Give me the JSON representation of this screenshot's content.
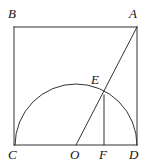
{
  "figure": {
    "kind": "plane-geometry-diagram",
    "stroke_color": "#333333",
    "background_color": "#ffffff",
    "stroke_width": 1,
    "canvas": {
      "width": 150,
      "height": 166
    }
  },
  "points": {
    "B": {
      "label": "B",
      "x": 14,
      "y": 27,
      "label_x": 8,
      "label_y": 7
    },
    "A": {
      "label": "A",
      "x": 137,
      "y": 27,
      "label_x": 129,
      "label_y": 7
    },
    "C": {
      "label": "C",
      "x": 14,
      "y": 145,
      "label_x": 8,
      "label_y": 148
    },
    "D": {
      "label": "D",
      "x": 137,
      "y": 145,
      "label_x": 129,
      "label_y": 148
    },
    "O": {
      "label": "O",
      "x": 76,
      "y": 145,
      "label_x": 70,
      "label_y": 148
    },
    "F": {
      "label": "F",
      "x": 104,
      "y": 145,
      "label_x": 99,
      "label_y": 148
    },
    "E": {
      "label": "E",
      "x": 104,
      "y": 95,
      "label_x": 91,
      "label_y": 73
    }
  },
  "segments": [
    {
      "name": "side-BC",
      "from": "B",
      "to": "C"
    },
    {
      "name": "side-BA",
      "from": "B",
      "to": "A"
    },
    {
      "name": "side-AD",
      "from": "A",
      "to": "D"
    },
    {
      "name": "side-CD",
      "from": "C",
      "to": "D"
    },
    {
      "name": "diagonal-OA",
      "from": "O",
      "to": "A"
    },
    {
      "name": "perpendicular-EF",
      "from": "E",
      "to": "F"
    }
  ],
  "arc": {
    "name": "semicircle-CD",
    "center": "O",
    "center_x": 76,
    "center_y": 145,
    "radius": 61,
    "start_x": 15,
    "start_y": 145,
    "end_x": 137,
    "end_y": 145,
    "path": "M 15 145 A 61 61 0 0 1 137 145"
  },
  "labels": {
    "B": "B",
    "A": "A",
    "E": "E",
    "C": "C",
    "O": "O",
    "F": "F",
    "D": "D"
  }
}
